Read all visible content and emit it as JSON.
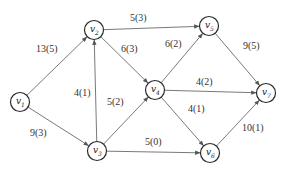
{
  "diagram": {
    "type": "directed-network-flow-graph",
    "nodes": [
      {
        "id": "v1",
        "label": "v",
        "sub": "1",
        "x": 20,
        "y": 102
      },
      {
        "id": "v2",
        "label": "v",
        "sub": "2",
        "x": 94,
        "y": 30
      },
      {
        "id": "v5",
        "label": "v",
        "sub": "5",
        "x": 209,
        "y": 26
      },
      {
        "id": "v4",
        "label": "v",
        "sub": "4",
        "x": 155,
        "y": 90
      },
      {
        "id": "v3",
        "label": "v",
        "sub": "3",
        "x": 97,
        "y": 151
      },
      {
        "id": "v6",
        "label": "v",
        "sub": "6",
        "x": 210,
        "y": 153
      },
      {
        "id": "v7",
        "label": "v",
        "sub": "7",
        "x": 266,
        "y": 93
      }
    ],
    "edges": [
      {
        "from": "v1",
        "to": "v2",
        "label": "13(5)",
        "lx": 36,
        "ly": 52
      },
      {
        "from": "v1",
        "to": "v3",
        "label": "9(3)",
        "lx": 30,
        "ly": 136
      },
      {
        "from": "v3",
        "to": "v2",
        "label": "4(1)",
        "lx": 74,
        "ly": 96
      },
      {
        "from": "v2",
        "to": "v5",
        "label": "5(3)",
        "lx": 130,
        "ly": 21
      },
      {
        "from": "v2",
        "to": "v4",
        "label": "6(3)",
        "lx": 121,
        "ly": 52
      },
      {
        "from": "v3",
        "to": "v4",
        "label": "5(2)",
        "lx": 107,
        "ly": 105
      },
      {
        "from": "v3",
        "to": "v6",
        "label": "5(0)",
        "lx": 145,
        "ly": 145
      },
      {
        "from": "v4",
        "to": "v5",
        "label": "6(2)",
        "lx": 165,
        "ly": 47
      },
      {
        "from": "v4",
        "to": "v7",
        "label": "4(2)",
        "lx": 196,
        "ly": 85
      },
      {
        "from": "v4",
        "to": "v6",
        "label": "4(1)",
        "lx": 188,
        "ly": 112
      },
      {
        "from": "v5",
        "to": "v7",
        "label": "9(5)",
        "lx": 243,
        "ly": 49
      },
      {
        "from": "v6",
        "to": "v7",
        "label": "10(1)",
        "lx": 242,
        "ly": 131
      }
    ],
    "colors": {
      "edge": "#6a6a6a",
      "node_stroke": "#2a2a2a",
      "text": "#333333",
      "background": "#ffffff"
    }
  }
}
